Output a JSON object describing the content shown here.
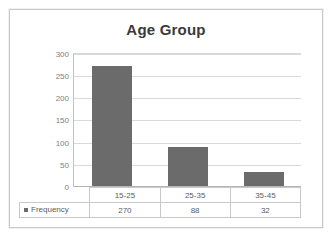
{
  "chart_data": {
    "type": "bar",
    "title": "Age Group",
    "xlabel": "",
    "ylabel": "",
    "categories": [
      "15-25",
      "25-35",
      "35-45"
    ],
    "values": [
      270,
      88,
      32
    ],
    "series": [
      {
        "name": "Frequency",
        "values": [
          270,
          88,
          32
        ]
      }
    ],
    "yticks": [
      300,
      250,
      200,
      150,
      100,
      50,
      0
    ],
    "ylim": [
      0,
      300
    ],
    "grid": true,
    "legend_position": "data-table",
    "colors": {
      "bar": "#6b6b6b",
      "gridline": "#d9d9d9",
      "axis": "#b5b5b5",
      "title_text": "#3a3a3a",
      "tick_text": "#808080",
      "table_border": "#c9c9c9",
      "frame_border": "#c9c9c9"
    },
    "data_table": {
      "series_label": "Frequency",
      "header_row": [
        "15-25",
        "25-35",
        "35-45"
      ],
      "value_row": [
        "270",
        "88",
        "32"
      ]
    }
  }
}
